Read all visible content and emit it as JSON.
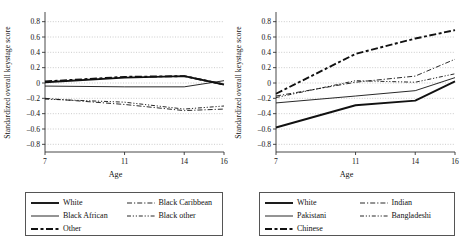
{
  "figure": {
    "panels": [
      {
        "id": "left",
        "ylabel": "Standardized overall keystage score",
        "xlabel": "Age",
        "legend": {
          "items": [
            {
              "label": "White",
              "style": "solid-thick"
            },
            {
              "label": "Black Caribbean",
              "style": "dash-dot"
            },
            {
              "label": "Black African",
              "style": "solid-thin"
            },
            {
              "label": "Black other",
              "style": "dash-dot-dot"
            },
            {
              "label": "Other",
              "style": "long-dash"
            }
          ]
        }
      },
      {
        "id": "right",
        "ylabel": "Standardized overall keystage score",
        "xlabel": "Age",
        "legend": {
          "items": [
            {
              "label": "White",
              "style": "solid-thick"
            },
            {
              "label": "Indian",
              "style": "dash-dot"
            },
            {
              "label": "Pakistani",
              "style": "solid-thin"
            },
            {
              "label": "Bangladeshi",
              "style": "dash-dot-dot"
            },
            {
              "label": "Chinese",
              "style": "long-dash"
            }
          ]
        }
      }
    ]
  },
  "chart_data": [
    {
      "type": "line",
      "panel": "left",
      "title": "",
      "xlabel": "Age",
      "ylabel": "Standardized overall keystage score",
      "x": [
        7,
        11,
        14,
        16
      ],
      "xticks": [
        7,
        11,
        14,
        16
      ],
      "xlim": [
        7,
        16
      ],
      "ylim": [
        -0.9,
        0.9
      ],
      "yticks": [
        -0.8,
        -0.6,
        -0.4,
        -0.2,
        0,
        0.2,
        0.4,
        0.6,
        0.8
      ],
      "ytick_labels": [
        "-0.8",
        "-0.6",
        "-0.4",
        "-0.2",
        "0",
        "0.2",
        "0.4",
        "0.6",
        "0.8"
      ],
      "grid": true,
      "legend_position": "below",
      "series": [
        {
          "name": "White",
          "style": "solid-thick",
          "values": [
            0.01,
            0.07,
            0.09,
            -0.02
          ]
        },
        {
          "name": "Black African",
          "style": "solid-thin",
          "values": [
            -0.04,
            -0.05,
            -0.05,
            0.03
          ]
        },
        {
          "name": "Other",
          "style": "long-dash",
          "values": [
            0.02,
            0.08,
            0.09,
            -0.02
          ]
        },
        {
          "name": "Black Caribbean",
          "style": "dash-dot",
          "values": [
            -0.2,
            -0.28,
            -0.36,
            -0.34
          ]
        },
        {
          "name": "Black other",
          "style": "dash-dot-dot",
          "values": [
            -0.21,
            -0.25,
            -0.34,
            -0.3
          ]
        }
      ]
    },
    {
      "type": "line",
      "panel": "right",
      "title": "",
      "xlabel": "Age",
      "ylabel": "Standardized overall keystage score",
      "x": [
        7,
        11,
        14,
        16
      ],
      "xticks": [
        7,
        11,
        14,
        16
      ],
      "xlim": [
        7,
        16
      ],
      "ylim": [
        -0.9,
        0.9
      ],
      "yticks": [
        -0.8,
        -0.6,
        -0.4,
        -0.2,
        0,
        0.2,
        0.4,
        0.6,
        0.8
      ],
      "ytick_labels": [
        "-0.8",
        "-0.6",
        "-0.4",
        "-0.2",
        "0",
        "0.2",
        "0.4",
        "0.6",
        "0.8"
      ],
      "grid": true,
      "legend_position": "below",
      "series": [
        {
          "name": "White",
          "style": "solid-thick",
          "values": [
            -0.58,
            -0.29,
            -0.23,
            0.02
          ]
        },
        {
          "name": "Pakistani",
          "style": "solid-thin",
          "values": [
            -0.26,
            -0.17,
            -0.1,
            0.07
          ]
        },
        {
          "name": "Chinese",
          "style": "long-dash",
          "values": [
            -0.14,
            0.38,
            0.58,
            0.69
          ]
        },
        {
          "name": "Indian",
          "style": "dash-dot",
          "values": [
            -0.17,
            0.01,
            0.09,
            0.31
          ]
        },
        {
          "name": "Bangladeshi",
          "style": "dash-dot-dot",
          "values": [
            -0.19,
            0.03,
            0.01,
            0.12
          ]
        }
      ]
    }
  ]
}
